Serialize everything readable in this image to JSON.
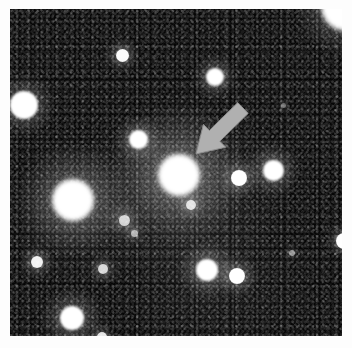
{
  "image": {
    "kind": "astronomical-photographic-plate",
    "caption_text": "",
    "canvas": {
      "width": 352,
      "height": 348
    },
    "border_color": "#fdfdfd",
    "plate": {
      "x": 10,
      "y": 9,
      "width": 332,
      "height": 327
    },
    "sky_color": "#060606",
    "star_color": "#ffffff"
  },
  "marker": {
    "name": "arrow-marker",
    "label": "",
    "color": "#b0b0b0",
    "edge_color": "#8e8e8e",
    "direction": "down-left",
    "tail": {
      "x": 243,
      "y": 108
    },
    "tip": {
      "x": 196,
      "y": 154
    },
    "points_at_object": "central-bright-object"
  },
  "chart_data": {
    "type": "scatter",
    "title": "",
    "xlabel": "",
    "ylabel": "",
    "xlim": [
      10,
      342
    ],
    "ylim": [
      9,
      336
    ],
    "grid": false,
    "legend": null,
    "note": "Star field: each point is a detected source; r = apparent radius in px, b = peak brightness 0-1, halo = diffuse glow radius factor",
    "points": [
      {
        "id": "s01",
        "name": "corner-blob-top-right",
        "x": 346,
        "y": 6,
        "r": 25,
        "b": 1.0,
        "halo": 1.5
      },
      {
        "id": "s02",
        "name": "star-upper-left-bright",
        "x": 24,
        "y": 105,
        "r": 14,
        "b": 1.0,
        "halo": 1.6
      },
      {
        "id": "s03",
        "name": "star-upper-mid-small",
        "x": 122,
        "y": 55,
        "r": 6.5,
        "b": 0.97,
        "halo": 1.8
      },
      {
        "id": "s04",
        "name": "star-upper-mid-right",
        "x": 215,
        "y": 77,
        "r": 9,
        "b": 1.0,
        "halo": 1.7
      },
      {
        "id": "s05",
        "name": "star-left-of-center",
        "x": 138,
        "y": 139,
        "r": 9.5,
        "b": 1.0,
        "halo": 1.7
      },
      {
        "id": "s06",
        "name": "central-bright-object",
        "x": 179,
        "y": 175,
        "r": 21,
        "b": 1.0,
        "halo": 2.1
      },
      {
        "id": "s07",
        "name": "star-left-large",
        "x": 73,
        "y": 200,
        "r": 21,
        "b": 1.0,
        "halo": 1.8
      },
      {
        "id": "s08",
        "name": "star-right-inner",
        "x": 239,
        "y": 178,
        "r": 8,
        "b": 1.0,
        "halo": 1.8
      },
      {
        "id": "s09",
        "name": "star-right-outer",
        "x": 273,
        "y": 170,
        "r": 10.5,
        "b": 1.0,
        "halo": 1.8
      },
      {
        "id": "s10",
        "name": "star-right-edge-clipped",
        "x": 344,
        "y": 241,
        "r": 8,
        "b": 1.0,
        "halo": 1.6
      },
      {
        "id": "s11",
        "name": "star-below-center-faint",
        "x": 191,
        "y": 205,
        "r": 5,
        "b": 0.8,
        "halo": 2.0
      },
      {
        "id": "s12",
        "name": "star-mid-left-faint",
        "x": 124,
        "y": 220,
        "r": 5.5,
        "b": 0.75,
        "halo": 2.2
      },
      {
        "id": "s13",
        "name": "star-mid-left-tiny",
        "x": 134,
        "y": 233,
        "r": 3.5,
        "b": 0.6,
        "halo": 2.2
      },
      {
        "id": "s14",
        "name": "star-lower-left-small",
        "x": 37,
        "y": 262,
        "r": 6,
        "b": 0.92,
        "halo": 1.9
      },
      {
        "id": "s15",
        "name": "star-lower-mid-faint",
        "x": 103,
        "y": 269,
        "r": 5,
        "b": 0.78,
        "halo": 2.0
      },
      {
        "id": "s16",
        "name": "star-lower-center",
        "x": 207,
        "y": 270,
        "r": 11,
        "b": 1.0,
        "halo": 1.8
      },
      {
        "id": "s17",
        "name": "star-lower-right-small",
        "x": 237,
        "y": 276,
        "r": 8,
        "b": 1.0,
        "halo": 1.8
      },
      {
        "id": "s18",
        "name": "star-bottom-left-bright",
        "x": 72,
        "y": 318,
        "r": 12,
        "b": 1.0,
        "halo": 1.8
      },
      {
        "id": "s19",
        "name": "star-bottom-edge-clipped",
        "x": 102,
        "y": 337,
        "r": 5,
        "b": 0.85,
        "halo": 1.8
      },
      {
        "id": "s20",
        "name": "star-right-faint-high",
        "x": 292,
        "y": 253,
        "r": 3,
        "b": 0.45,
        "halo": 2.0
      },
      {
        "id": "s21",
        "name": "star-upper-right-faint",
        "x": 283,
        "y": 105,
        "r": 2.5,
        "b": 0.35,
        "halo": 2.0
      }
    ]
  }
}
